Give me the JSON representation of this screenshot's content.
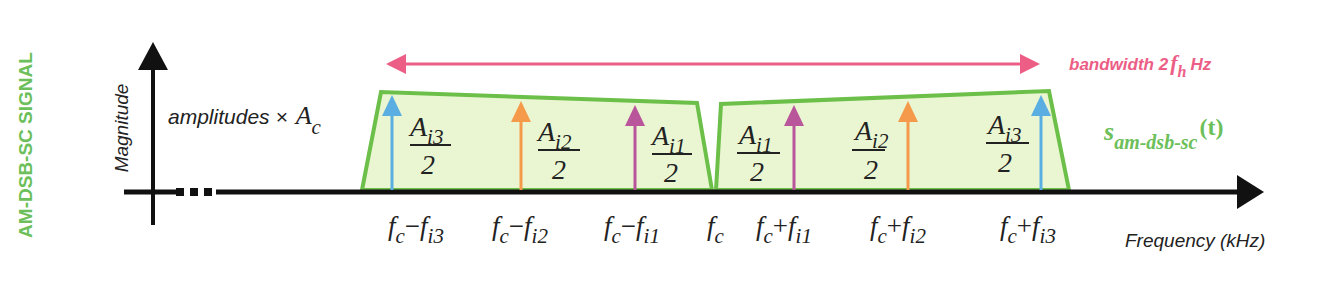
{
  "title": "AM-DSB-SC SIGNAL",
  "colors": {
    "title_green": "#6cbf5a",
    "band_fill": "#eaf6d2",
    "band_stroke": "#6cc04a",
    "axis": "#111111",
    "bandwidth_pink": "#ec5e86",
    "signal_green": "#6cbf5a",
    "arrow_i1": "#b9559b",
    "arrow_i2": "#f59a4a",
    "arrow_i3": "#5aaee2"
  },
  "axes": {
    "y_label": "Magnitude",
    "x_label": "Frequency (kHz)",
    "amplitude_note": "amplitudes ×",
    "amplitude_symbol": "A",
    "amplitude_sub": "c"
  },
  "bandwidth": {
    "label_prefix": "bandwidth 2",
    "label_var": "f",
    "label_sub": "h",
    "label_suffix": "Hz"
  },
  "signal_label": {
    "symbol": "s",
    "sub": "am-dsb-sc",
    "arg": "(t)"
  },
  "lower_sideband": {
    "components": [
      {
        "id": "i3",
        "amp_num": "A",
        "amp_sub": "i3",
        "amp_den": "2",
        "freq_a": "f",
        "freq_a_sub": "c",
        "op": "−",
        "freq_b": "f",
        "freq_b_sub": "i3"
      },
      {
        "id": "i2",
        "amp_num": "A",
        "amp_sub": "i2",
        "amp_den": "2",
        "freq_a": "f",
        "freq_a_sub": "c",
        "op": "−",
        "freq_b": "f",
        "freq_b_sub": "i2"
      },
      {
        "id": "i1",
        "amp_num": "A",
        "amp_sub": "i1",
        "amp_den": "2",
        "freq_a": "f",
        "freq_a_sub": "c",
        "op": "−",
        "freq_b": "f",
        "freq_b_sub": "i1"
      }
    ]
  },
  "carrier": {
    "freq": "f",
    "freq_sub": "c"
  },
  "upper_sideband": {
    "components": [
      {
        "id": "i1",
        "amp_num": "A",
        "amp_sub": "i1",
        "amp_den": "2",
        "freq_a": "f",
        "freq_a_sub": "c",
        "op": "+",
        "freq_b": "f",
        "freq_b_sub": "i1"
      },
      {
        "id": "i2",
        "amp_num": "A",
        "amp_sub": "i2",
        "amp_den": "2",
        "freq_a": "f",
        "freq_a_sub": "c",
        "op": "+",
        "freq_b": "f",
        "freq_b_sub": "i2"
      },
      {
        "id": "i3",
        "amp_num": "A",
        "amp_sub": "i3",
        "amp_den": "2",
        "freq_a": "f",
        "freq_a_sub": "c",
        "op": "+",
        "freq_b": "f",
        "freq_b_sub": "i3"
      }
    ]
  }
}
